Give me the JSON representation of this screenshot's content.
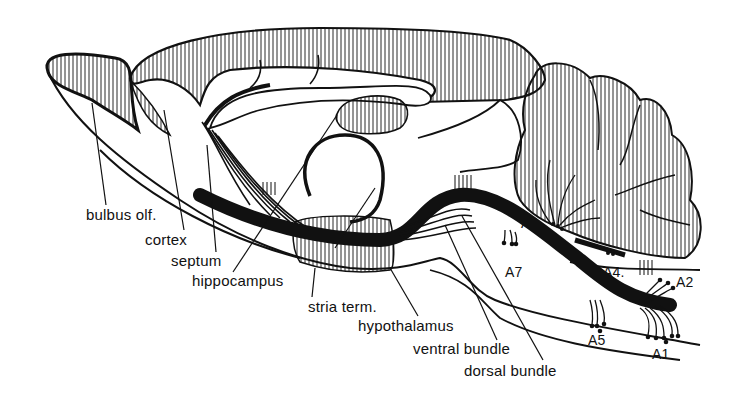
{
  "diagram": {
    "colors": {
      "ink": "#111111",
      "background": "#ffffff"
    },
    "labels": {
      "bulbus_olf": "bulbus olf.",
      "cortex": "cortex",
      "septum": "septum",
      "hippocampus": "hippocampus",
      "stria_term": "stria term.",
      "hypothalamus": "hypothalamus",
      "ventral_bundle": "ventral bundle",
      "dorsal_bundle": "dorsal bundle",
      "a1": "A1",
      "a2": "A2",
      "a4": "A4.",
      "a5": "A5",
      "a6": "A6",
      "a7": "A7"
    }
  }
}
